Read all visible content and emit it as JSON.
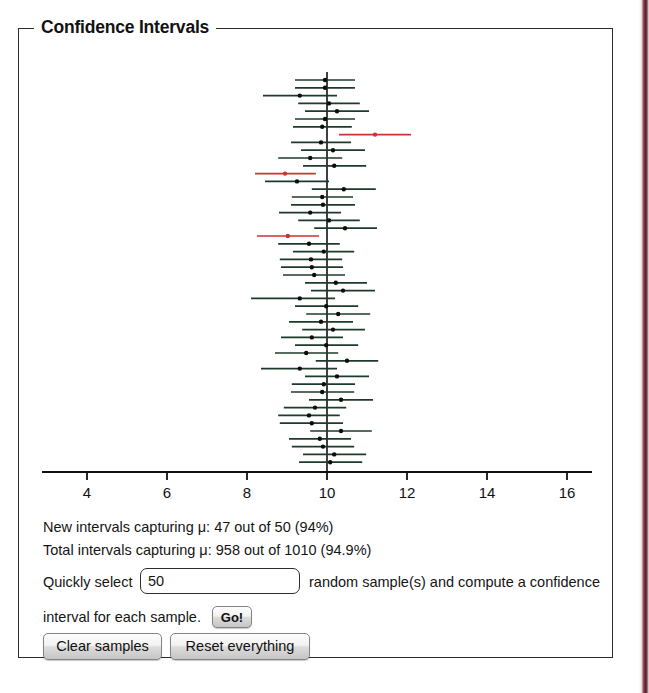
{
  "groupbox": {
    "legend": "Confidence Intervals"
  },
  "stats": {
    "new_intervals": "New intervals capturing μ: 47 out of 50 (94%)",
    "total_intervals": "Total intervals capturing μ: 958 out of 1010 (94.9%)",
    "new_captured": 47,
    "new_total": 50,
    "new_percent": "94%",
    "total_captured": 958,
    "total_total": 1010,
    "total_percent": "94.9%"
  },
  "controls": {
    "label_quickly": "Quickly select",
    "label_random": "random sample(s) and compute a confidence",
    "label_interval": "interval for each sample.",
    "sample_count_value": "50",
    "sample_count_placeholder": "50",
    "go_label": "Go!",
    "clear_label": "Clear samples",
    "reset_label": "Reset everything"
  },
  "colors": {
    "capture": "#1d3b2a",
    "miss": "#cc3333",
    "axis": "#101010",
    "mu_line": "#101010",
    "point": "#0d0d0d",
    "frame": "#2b2b2b",
    "page_edge": "#5a1f2b"
  },
  "chart_data": {
    "type": "line",
    "title": "Confidence Intervals",
    "xlabel": "",
    "ylabel": "",
    "xlim": [
      2.8,
      17.2
    ],
    "ylim": [
      0,
      50
    ],
    "grid": false,
    "legend": "none",
    "xticks": [
      4,
      6,
      8,
      10,
      12,
      14,
      16
    ],
    "xtick_labels": [
      "4",
      "6",
      "8",
      "10",
      "12",
      "14",
      "16"
    ],
    "mu": 10,
    "mu_line_label": "μ",
    "axis_y_px": 472,
    "plot_top_px": 76,
    "row_spacing_px": 7.8,
    "px_per_unit": 40,
    "x_origin_px": 327,
    "intervals": [
      {
        "i": 1,
        "center": 9.95,
        "low": 9.2,
        "high": 10.7,
        "captures": true
      },
      {
        "i": 2,
        "center": 9.95,
        "low": 9.2,
        "high": 10.7,
        "captures": true
      },
      {
        "i": 3,
        "center": 9.32,
        "low": 8.4,
        "high": 10.25,
        "captures": true
      },
      {
        "i": 4,
        "center": 10.05,
        "low": 9.28,
        "high": 10.82,
        "captures": true
      },
      {
        "i": 5,
        "center": 10.25,
        "low": 9.45,
        "high": 11.05,
        "captures": true
      },
      {
        "i": 6,
        "center": 9.95,
        "low": 9.2,
        "high": 10.7,
        "captures": true
      },
      {
        "i": 7,
        "center": 9.88,
        "low": 9.15,
        "high": 10.62,
        "captures": true
      },
      {
        "i": 8,
        "center": 11.2,
        "low": 10.3,
        "high": 12.1,
        "captures": false
      },
      {
        "i": 9,
        "center": 9.85,
        "low": 9.1,
        "high": 10.6,
        "captures": true
      },
      {
        "i": 10,
        "center": 10.15,
        "low": 9.35,
        "high": 10.95,
        "captures": true
      },
      {
        "i": 11,
        "center": 9.58,
        "low": 8.78,
        "high": 10.38,
        "captures": true
      },
      {
        "i": 12,
        "center": 10.18,
        "low": 9.4,
        "high": 10.98,
        "captures": true
      },
      {
        "i": 13,
        "center": 8.95,
        "low": 8.2,
        "high": 9.72,
        "captures": false
      },
      {
        "i": 14,
        "center": 9.25,
        "low": 8.45,
        "high": 10.05,
        "captures": true
      },
      {
        "i": 15,
        "center": 10.42,
        "low": 9.62,
        "high": 11.22,
        "captures": true
      },
      {
        "i": 16,
        "center": 9.88,
        "low": 9.12,
        "high": 10.65,
        "captures": true
      },
      {
        "i": 17,
        "center": 9.9,
        "low": 9.1,
        "high": 10.7,
        "captures": true
      },
      {
        "i": 18,
        "center": 9.58,
        "low": 8.8,
        "high": 10.35,
        "captures": true
      },
      {
        "i": 19,
        "center": 10.05,
        "low": 9.28,
        "high": 10.82,
        "captures": true
      },
      {
        "i": 20,
        "center": 10.45,
        "low": 9.68,
        "high": 11.25,
        "captures": true
      },
      {
        "i": 21,
        "center": 9.02,
        "low": 8.25,
        "high": 9.8,
        "captures": false
      },
      {
        "i": 22,
        "center": 9.55,
        "low": 8.78,
        "high": 10.32,
        "captures": true
      },
      {
        "i": 23,
        "center": 9.92,
        "low": 9.15,
        "high": 10.68,
        "captures": true
      },
      {
        "i": 24,
        "center": 9.6,
        "low": 8.82,
        "high": 10.38,
        "captures": true
      },
      {
        "i": 25,
        "center": 9.62,
        "low": 8.85,
        "high": 10.4,
        "captures": true
      },
      {
        "i": 26,
        "center": 9.68,
        "low": 8.9,
        "high": 10.45,
        "captures": true
      },
      {
        "i": 27,
        "center": 10.22,
        "low": 9.45,
        "high": 11.0,
        "captures": true
      },
      {
        "i": 28,
        "center": 10.4,
        "low": 9.6,
        "high": 11.2,
        "captures": true
      },
      {
        "i": 29,
        "center": 9.32,
        "low": 8.1,
        "high": 10.2,
        "captures": true
      },
      {
        "i": 30,
        "center": 9.98,
        "low": 9.2,
        "high": 10.78,
        "captures": true
      },
      {
        "i": 31,
        "center": 10.28,
        "low": 9.48,
        "high": 11.08,
        "captures": true
      },
      {
        "i": 32,
        "center": 9.85,
        "low": 9.05,
        "high": 10.65,
        "captures": true
      },
      {
        "i": 33,
        "center": 10.15,
        "low": 9.38,
        "high": 10.95,
        "captures": true
      },
      {
        "i": 34,
        "center": 9.62,
        "low": 8.85,
        "high": 10.4,
        "captures": true
      },
      {
        "i": 35,
        "center": 9.98,
        "low": 9.2,
        "high": 10.78,
        "captures": true
      },
      {
        "i": 36,
        "center": 9.48,
        "low": 8.7,
        "high": 10.28,
        "captures": true
      },
      {
        "i": 37,
        "center": 10.5,
        "low": 9.72,
        "high": 11.28,
        "captures": true
      },
      {
        "i": 38,
        "center": 9.32,
        "low": 8.35,
        "high": 10.25,
        "captures": true
      },
      {
        "i": 39,
        "center": 10.25,
        "low": 9.45,
        "high": 11.05,
        "captures": true
      },
      {
        "i": 40,
        "center": 9.92,
        "low": 9.12,
        "high": 10.7,
        "captures": true
      },
      {
        "i": 41,
        "center": 9.88,
        "low": 9.1,
        "high": 10.68,
        "captures": true
      },
      {
        "i": 42,
        "center": 10.35,
        "low": 9.55,
        "high": 11.15,
        "captures": true
      },
      {
        "i": 43,
        "center": 9.7,
        "low": 8.92,
        "high": 10.48,
        "captures": true
      },
      {
        "i": 44,
        "center": 9.55,
        "low": 8.78,
        "high": 10.32,
        "captures": true
      },
      {
        "i": 45,
        "center": 9.62,
        "low": 8.82,
        "high": 10.4,
        "captures": true
      },
      {
        "i": 46,
        "center": 10.35,
        "low": 9.58,
        "high": 11.12,
        "captures": true
      },
      {
        "i": 47,
        "center": 9.82,
        "low": 9.05,
        "high": 10.6,
        "captures": true
      },
      {
        "i": 48,
        "center": 9.9,
        "low": 9.12,
        "high": 10.68,
        "captures": true
      },
      {
        "i": 49,
        "center": 10.18,
        "low": 9.4,
        "high": 10.98,
        "captures": true
      },
      {
        "i": 50,
        "center": 10.08,
        "low": 9.3,
        "high": 10.88,
        "captures": true
      }
    ]
  }
}
